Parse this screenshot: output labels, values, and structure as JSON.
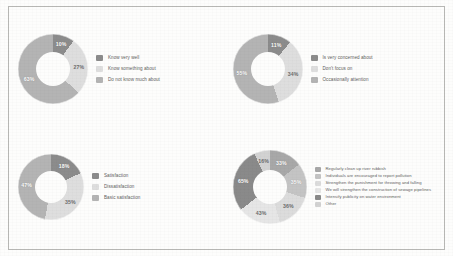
{
  "palette": {
    "dark": "#8c8c8c",
    "medium": "#a8a8a8",
    "light": "#cfcfcf",
    "lighter": "#dedede",
    "lightest": "#e9e9e9",
    "darkest": "#7b7b7b",
    "border": "#b9b9b6",
    "background": "#fdfdfc",
    "label_text": "#5d5d5d"
  },
  "charts": [
    {
      "id": "awareness-donut",
      "name": "awareness",
      "type": "doughnut",
      "title": "",
      "labels": [
        "Know very well",
        "Know something about",
        "Do not know much about"
      ],
      "values": [
        10,
        27,
        63
      ],
      "value_labels": [
        "10%",
        "27%",
        "63%"
      ],
      "colors": [
        "#8c8c8c",
        "#dedede",
        "#b4b4b4"
      ],
      "legend_position": "right"
    },
    {
      "id": "concern-donut",
      "name": "concern",
      "type": "doughnut",
      "title": "",
      "labels": [
        "Is very concerned about",
        "Don't focus on",
        "Occasionally attention"
      ],
      "values": [
        11,
        34,
        55
      ],
      "value_labels": [
        "11%",
        "34%",
        "55%"
      ],
      "colors": [
        "#8c8c8c",
        "#dedede",
        "#b4b4b4"
      ],
      "legend_position": "right"
    },
    {
      "id": "satisfaction-donut",
      "name": "satisfaction",
      "type": "doughnut",
      "title": "",
      "labels": [
        "Satisfaction",
        "Dissatisfaction",
        "Basic satisfaction"
      ],
      "values": [
        18,
        35,
        47
      ],
      "value_labels": [
        "18%",
        "35%",
        "47%"
      ],
      "colors": [
        "#8c8c8c",
        "#dedede",
        "#b4b4b4"
      ],
      "legend_position": "right"
    },
    {
      "id": "measures-donut",
      "name": "measures",
      "type": "doughnut",
      "title": "",
      "labels": [
        "Regularly clean up river rubbish",
        "Individuals are encouraged to report pollution",
        "Strengthen the punishment for throwing and falling",
        "We will strengthen the construction of sewage pipelines",
        "Intensify publicity on water environment",
        "Other"
      ],
      "values": [
        33,
        35,
        36,
        43,
        65,
        16
      ],
      "value_labels": [
        "33%",
        "35%",
        "36%",
        "43%",
        "65%",
        "16%"
      ],
      "colors": [
        "#a8a8a8",
        "#c4c4c4",
        "#dcdcdc",
        "#e6e6e6",
        "#8a8a8a",
        "#d2d2d2"
      ],
      "legend_position": "right"
    }
  ],
  "chart_data": [
    {
      "type": "pie",
      "title": "Awareness of river chief system",
      "categories": [
        "Know very well",
        "Know something about",
        "Do not know much about"
      ],
      "values": [
        10,
        27,
        63
      ],
      "unit": "%",
      "donut": true,
      "legend": "right"
    },
    {
      "type": "pie",
      "title": "Level of concern",
      "categories": [
        "Is very concerned about",
        "Don't focus on",
        "Occasionally attention"
      ],
      "values": [
        11,
        34,
        55
      ],
      "unit": "%",
      "donut": true,
      "legend": "right"
    },
    {
      "type": "pie",
      "title": "Satisfaction level",
      "categories": [
        "Satisfaction",
        "Dissatisfaction",
        "Basic satisfaction"
      ],
      "values": [
        18,
        35,
        47
      ],
      "unit": "%",
      "donut": true,
      "legend": "right"
    },
    {
      "type": "pie",
      "title": "Suggested measures",
      "categories": [
        "Regularly clean up river rubbish",
        "Individuals are encouraged to report pollution",
        "Strengthen the punishment for throwing and falling",
        "We will strengthen the construction of sewage pipelines",
        "Intensify publicity on water environment",
        "Other"
      ],
      "values": [
        33,
        35,
        36,
        43,
        65,
        16
      ],
      "unit": "%",
      "donut": true,
      "legend": "right",
      "note": "multi-response percentages, do not sum to 100"
    }
  ]
}
